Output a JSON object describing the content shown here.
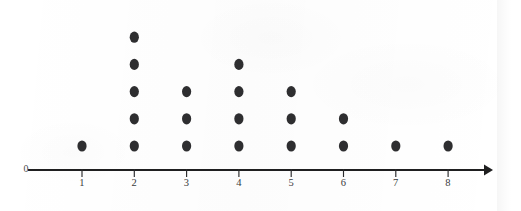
{
  "chart_data": {
    "type": "scatter",
    "plot_kind": "dot-plot",
    "title": "",
    "subtitle": "",
    "xlabel": "",
    "ylabel": "",
    "categories": [
      "1",
      "2",
      "3",
      "4",
      "5",
      "6",
      "7",
      "8"
    ],
    "values": [
      1,
      5,
      3,
      4,
      3,
      2,
      1,
      1
    ],
    "total_dots": 20,
    "origin_label": "0",
    "tick_labels": [
      "1",
      "2",
      "3",
      "4",
      "5",
      "6",
      "7",
      "8"
    ],
    "axis_range": [
      0,
      8
    ],
    "axis_has_arrow": true,
    "grid": false,
    "legend": false,
    "legend_position": "none",
    "dot_color": "#2e2e30",
    "axis_color": "#1f1f20",
    "label_color": "#3a3a3c",
    "background_color": "#ffffff",
    "series": [
      {
        "name": "frequency",
        "values": [
          1,
          5,
          3,
          4,
          3,
          2,
          1,
          1
        ]
      }
    ],
    "points": [
      {
        "x": "1",
        "count": 1
      },
      {
        "x": "2",
        "count": 5
      },
      {
        "x": "3",
        "count": 3
      },
      {
        "x": "4",
        "count": 4
      },
      {
        "x": "5",
        "count": 3
      },
      {
        "x": "6",
        "count": 2
      },
      {
        "x": "7",
        "count": 1
      },
      {
        "x": "8",
        "count": 1
      }
    ]
  },
  "layout": {
    "axis_y": 170,
    "axis_x_start": 28,
    "axis_x_end": 490,
    "first_tick_x": 82,
    "tick_spacing": 52.3,
    "tick_height": 7,
    "tick_label_y": 186,
    "origin_label_x": 26,
    "origin_label_y": 172,
    "baseline_dot_y": 146,
    "dot_row_spacing": 27.2,
    "dot_rx": 4.6,
    "dot_ry": 5.6
  }
}
